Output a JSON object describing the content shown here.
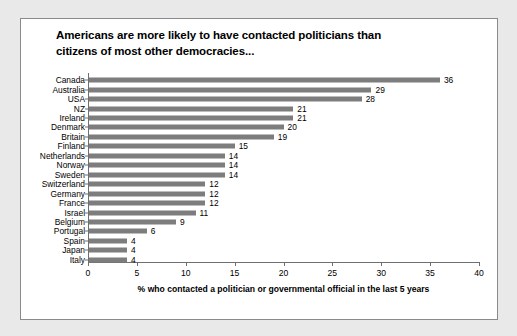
{
  "chart_data": {
    "type": "bar",
    "orientation": "horizontal",
    "title": "Americans are more likely to have contacted politicians than citizens of most other democracies...",
    "title_lines": [
      "Americans are more likely to have contacted politicians than",
      "citizens of most other democracies..."
    ],
    "xlabel": "% who contacted a politician or governmental official in the last 5 years",
    "ylabel": "",
    "xlim": [
      0,
      40
    ],
    "xticks": [
      0,
      5,
      10,
      15,
      20,
      25,
      30,
      35,
      40
    ],
    "xtick_labels": [
      "0",
      "5",
      "10",
      "15",
      "20",
      "25",
      "30",
      "35",
      "40"
    ],
    "grid": false,
    "legend": false,
    "bar_color": "#7d7d7d",
    "categories": [
      "Canada",
      "Australia",
      "USA",
      "NZ",
      "Ireland",
      "Denmark",
      "Britain",
      "Finland",
      "Netherlands",
      "Norway",
      "Sweden",
      "Switzerland",
      "Germany",
      "France",
      "Israel",
      "Belgium",
      "Portugal",
      "Spain",
      "Japan",
      "Italy"
    ],
    "values": [
      36,
      29,
      28,
      21,
      21,
      20,
      19,
      15,
      14,
      14,
      14,
      12,
      12,
      12,
      11,
      9,
      6,
      4,
      4,
      4
    ],
    "data_labels": [
      "36",
      "29",
      "28",
      "21",
      "21",
      "20",
      "19",
      "15",
      "14",
      "14",
      "14",
      "12",
      "12",
      "12",
      "11",
      "9",
      "6",
      "4",
      "4",
      "4"
    ]
  }
}
